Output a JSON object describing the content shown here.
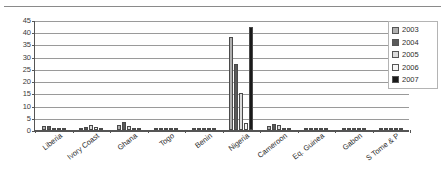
{
  "chart_data": {
    "type": "bar",
    "title": "",
    "subtitle": "",
    "xlabel": "",
    "ylabel": "",
    "ylim": [
      0,
      45
    ],
    "yticks": [
      0,
      5,
      10,
      15,
      20,
      25,
      30,
      35,
      40,
      45
    ],
    "ytick_labels": [
      "0",
      "5",
      "10",
      "15",
      "20",
      "25",
      "30",
      "35",
      "40",
      "45"
    ],
    "grid": true,
    "legend_position": "top-right",
    "categories": [
      "Liberia",
      "Ivory Coast",
      "Ghana",
      "Togo",
      "Benin",
      "Nigeria",
      "Cameroon",
      "Eq. Guinea",
      "Gabon",
      "S Tome & P"
    ],
    "series": [
      {
        "name": "2003",
        "color": "#b0b0b0",
        "values": [
          1.8,
          0.5,
          2.2,
          0.6,
          0.4,
          38.0,
          1.6,
          0.1,
          0.1,
          0.1
        ]
      },
      {
        "name": "2004",
        "color": "#5a5a5a",
        "values": [
          1.5,
          1.4,
          3.2,
          0.8,
          0.5,
          27.0,
          2.6,
          0.1,
          0.1,
          0.1
        ]
      },
      {
        "name": "2005",
        "color": "#dcdcdc",
        "values": [
          0.7,
          2.0,
          1.7,
          0.4,
          0.3,
          15.0,
          1.9,
          0.1,
          0.1,
          0.1
        ]
      },
      {
        "name": "2006",
        "color": "#f4f4f4",
        "values": [
          0.5,
          1.1,
          1.0,
          0.4,
          0.3,
          3.0,
          0.8,
          0.1,
          0.1,
          0.1
        ]
      },
      {
        "name": "2007",
        "color": "#1a1a1a",
        "values": [
          0.4,
          0.6,
          0.6,
          0.3,
          0.2,
          42.0,
          0.4,
          0.1,
          0.1,
          0.1
        ]
      }
    ],
    "legend_entries": [
      "2003",
      "2004",
      "2005",
      "2006",
      "2007"
    ]
  }
}
